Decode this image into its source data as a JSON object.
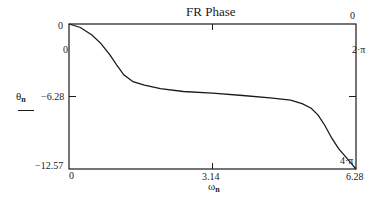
{
  "chart_data": {
    "type": "line",
    "title": "FR Phase",
    "xlabel": "ω_n",
    "ylabel": "θ_n",
    "xlim": [
      0,
      6.28
    ],
    "ylim": [
      -12.57,
      0
    ],
    "grid": false,
    "legend": null,
    "x_ticks": [
      "0",
      "3.14",
      "6.28"
    ],
    "y_ticks": [
      "0",
      "-6.28",
      "-12.57"
    ],
    "top_axis_ticks": [
      "0"
    ],
    "right_axis_ticks": [
      "0",
      "2·π",
      "4·π"
    ],
    "series": [
      {
        "name": "θ_n",
        "x": [
          0,
          0.25,
          0.5,
          0.7,
          0.9,
          1.05,
          1.2,
          1.4,
          1.65,
          2.0,
          2.5,
          3.14,
          3.8,
          4.4,
          4.85,
          5.1,
          5.3,
          5.45,
          5.6,
          5.75,
          5.9,
          6.05,
          6.18,
          6.28
        ],
        "values": [
          0,
          -0.3,
          -0.95,
          -1.7,
          -2.7,
          -3.6,
          -4.4,
          -5.0,
          -5.3,
          -5.6,
          -5.85,
          -6.0,
          -6.2,
          -6.4,
          -6.6,
          -6.9,
          -7.3,
          -7.9,
          -8.8,
          -9.9,
          -10.8,
          -11.5,
          -12.1,
          -12.57
        ]
      }
    ]
  },
  "labels": {
    "title": "FR Phase",
    "y_axis_symbol": "θ",
    "y_axis_sub": "n",
    "x_axis_symbol": "ω",
    "x_axis_sub": "n",
    "left_top": "0",
    "left_inner_top": "0",
    "left_mid": "−6.28",
    "left_bottom": "−12.57",
    "bottom_left": "0",
    "bottom_mid": "3.14",
    "bottom_right": "6.28",
    "top_right": "0",
    "right_mid": "2·π",
    "right_bottom": "4·π"
  },
  "colors": {
    "line": "#1a1a1a",
    "frame": "#1a1a1a",
    "background": "#ffffff"
  }
}
